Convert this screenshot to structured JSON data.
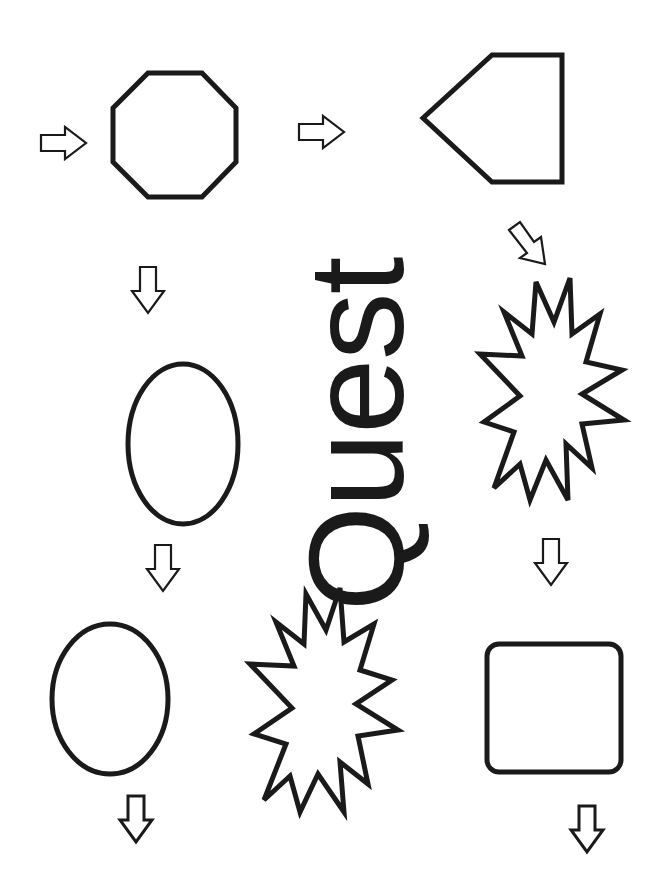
{
  "title": "Quest",
  "colors": {
    "stroke": "#1a1a1a",
    "background": "#ffffff"
  },
  "shapes": [
    {
      "name": "octagon",
      "label": "octagon"
    },
    {
      "name": "pentagon-arrow",
      "label": "pentagon"
    },
    {
      "name": "ellipse-large",
      "label": "oval"
    },
    {
      "name": "starburst-right",
      "label": "explosion"
    },
    {
      "name": "ellipse-small",
      "label": "oval"
    },
    {
      "name": "starburst-bottom",
      "label": "explosion"
    },
    {
      "name": "rounded-square",
      "label": "rounded square"
    }
  ],
  "arrows": [
    {
      "name": "arrow-right-1",
      "direction": "right"
    },
    {
      "name": "arrow-right-2",
      "direction": "right"
    },
    {
      "name": "arrow-down-diagonal",
      "direction": "down-right"
    },
    {
      "name": "arrow-down-1",
      "direction": "down"
    },
    {
      "name": "arrow-down-2",
      "direction": "down"
    },
    {
      "name": "arrow-down-3",
      "direction": "down"
    },
    {
      "name": "arrow-down-4",
      "direction": "down"
    },
    {
      "name": "arrow-down-5",
      "direction": "down"
    }
  ]
}
